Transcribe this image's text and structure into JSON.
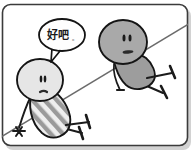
{
  "panel": {
    "name": "comic-panel",
    "width": 193,
    "height": 157,
    "background_color": "#ffffff",
    "border_color": "#3b3b3b",
    "border_radius": 8,
    "shadow_color": "#cfcfcf"
  },
  "speech_bubble": {
    "text": "好吧",
    "punctuation": "。",
    "full_text": "好吧。",
    "outline_color": "#141414",
    "fill_color": "#fefefe",
    "tail_direction": "down-left"
  },
  "rope": {
    "name": "diagonal-rope",
    "color": "#5a5a5a",
    "description": "diagonal line from upper-right to lower-left"
  },
  "figures": [
    {
      "id": "left-figure",
      "head_fill": "#e4e4e4",
      "body_fill": "#c9c9c9",
      "body_pattern": "diagonal-stripes",
      "stripe_color": "#8f8f8f",
      "outline_color": "#141414",
      "eyes": 2,
      "mouth": "small-curve",
      "legs": 2,
      "feet": 2
    },
    {
      "id": "right-figure",
      "head_fill": "#a8a8a8",
      "body_fill": "#9a9a9a",
      "body_pattern": "solid-cape",
      "outline_color": "#141414",
      "eyes": 2,
      "mouth": "flat-line",
      "legs": 2,
      "feet": 2
    }
  ]
}
